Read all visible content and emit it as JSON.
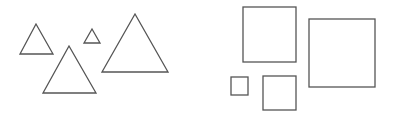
{
  "figure": {
    "width": 394,
    "height": 114,
    "background": "#ffffff",
    "stroke_color": "#555555",
    "stroke_width": 1.3,
    "groups": [
      {
        "name": "triangles",
        "shapes": [
          {
            "type": "triangle",
            "points": [
              [
                36,
                24
              ],
              [
                20,
                54
              ],
              [
                53,
                54
              ]
            ]
          },
          {
            "type": "triangle",
            "points": [
              [
                92,
                29
              ],
              [
                84,
                43
              ],
              [
                100,
                43
              ]
            ]
          },
          {
            "type": "triangle",
            "points": [
              [
                69,
                46
              ],
              [
                43,
                93
              ],
              [
                96,
                93
              ]
            ]
          },
          {
            "type": "triangle",
            "points": [
              [
                135,
                14
              ],
              [
                102,
                72
              ],
              [
                168,
                72
              ]
            ]
          }
        ]
      },
      {
        "name": "squares",
        "shapes": [
          {
            "type": "square",
            "x": 243,
            "y": 7,
            "w": 53,
            "h": 55
          },
          {
            "type": "square",
            "x": 309,
            "y": 19,
            "w": 66,
            "h": 68
          },
          {
            "type": "square",
            "x": 231,
            "y": 77,
            "w": 17,
            "h": 18
          },
          {
            "type": "square",
            "x": 263,
            "y": 76,
            "w": 33,
            "h": 34
          }
        ]
      }
    ]
  }
}
